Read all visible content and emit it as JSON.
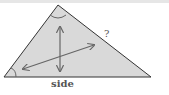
{
  "diagram": {
    "shape": "triangle",
    "fill": "#d9d9d9",
    "stroke": "#333333",
    "labels": {
      "base": "side",
      "right_side": "?"
    },
    "angle_marks": [
      "apex",
      "bottom-left"
    ],
    "arrows": [
      "vertical double-headed",
      "diagonal double-headed"
    ]
  }
}
